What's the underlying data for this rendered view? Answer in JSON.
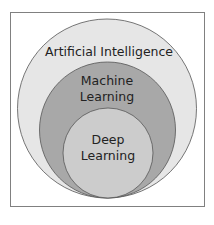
{
  "diagram": {
    "type": "nested-circles",
    "colors": {
      "frame_border": "#808080",
      "frame_fill": "#ffffff",
      "circle_stroke": "#555555",
      "artificial_intelligence": "#e6e6e6",
      "machine_learning": "#a8a8a8",
      "deep_learning": "#cccccc"
    },
    "circles": [
      {
        "name": "Artificial Intelligence",
        "label_lines": [
          "Artificial Intelligence"
        ]
      },
      {
        "name": "Machine Learning",
        "label_lines": [
          "Machine",
          "Learning"
        ]
      },
      {
        "name": "Deep Learning",
        "label_lines": [
          "Deep",
          "Learning"
        ]
      }
    ]
  }
}
